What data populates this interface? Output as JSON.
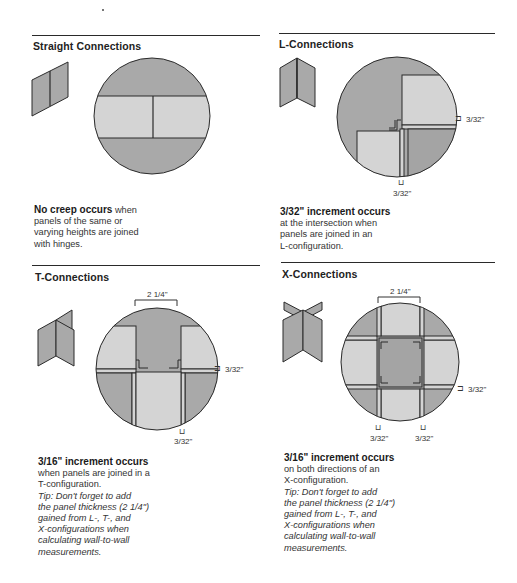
{
  "colors": {
    "dark_fill": "#a9a9a9",
    "light_fill": "#d4d4d4",
    "stroke": "#2b2b2b",
    "rule": "#2a2a2a"
  },
  "sections": [
    {
      "id": "straight",
      "title": "Straight Connections",
      "description": {
        "bold": "No creep occurs",
        "lines": [
          "when",
          "panels of the same or",
          "varying heights are joined",
          "with hinges."
        ]
      }
    },
    {
      "id": "l",
      "title": "L-Connections",
      "dimensions": {
        "right": "3/32\"",
        "bottom": "3/32\""
      },
      "description": {
        "bold": "3/32\" increment occurs",
        "lines": [
          "at the intersection when",
          "panels are joined in an",
          "L-configuration."
        ]
      }
    },
    {
      "id": "t",
      "title": "T-Connections",
      "dimensions": {
        "top": "2 1/4\"",
        "right": "3/32\"",
        "bottom": "3/32\""
      },
      "description": {
        "bold": "3/16\" increment occurs",
        "lines": [
          "when panels are joined in a",
          "T-configuration."
        ],
        "tip_lines": [
          "Tip: Don't forget to add",
          "the panel thickness (2 1/4\")",
          "gained from L-, T-, and",
          "X-configurations when",
          "calculating wall-to-wall",
          "measurements."
        ]
      }
    },
    {
      "id": "x",
      "title": "X-Connections",
      "dimensions": {
        "top": "2 1/4\"",
        "right": "3/32\"",
        "bottom_left": "3/32\"",
        "bottom_right": "3/32\""
      },
      "description": {
        "bold": "3/16\" increment occurs",
        "lines": [
          "on both directions of an",
          "X-configuration."
        ],
        "tip_lines": [
          "Tip: Don't forget to add",
          "the panel thickness (2 1/4\")",
          "gained from L-, T-, and",
          "X-configurations when",
          "calculating wall-to-wall",
          "measurements."
        ]
      }
    }
  ]
}
